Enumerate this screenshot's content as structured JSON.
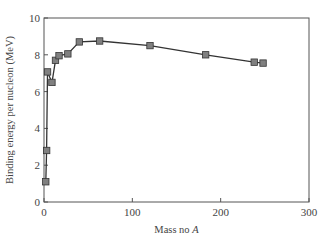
{
  "chart_data": {
    "type": "line",
    "title": "",
    "xlabel": "Mass no A",
    "xlabel_plain": "Mass no ",
    "xlabel_italic": "A",
    "ylabel": "Binding energy per nucleon (MeV)",
    "xlim": [
      0,
      300
    ],
    "ylim": [
      0,
      10
    ],
    "xticks": [
      0,
      100,
      200,
      300
    ],
    "yticks": [
      0,
      2,
      4,
      6,
      8,
      10
    ],
    "grid": false,
    "legend": null,
    "marker": "square",
    "series": [
      {
        "name": "Binding energy per nucleon",
        "x": [
          2,
          3,
          4,
          9,
          13,
          17,
          27,
          40,
          63,
          120,
          183,
          238,
          248
        ],
        "y": [
          1.1,
          2.8,
          7.07,
          6.5,
          7.7,
          7.95,
          8.05,
          8.7,
          8.75,
          8.5,
          8.0,
          7.6,
          7.55
        ]
      }
    ],
    "colors": {
      "line": "#333333",
      "marker_fill": "#808080",
      "marker_stroke": "#333333",
      "axis": "#555555"
    }
  }
}
